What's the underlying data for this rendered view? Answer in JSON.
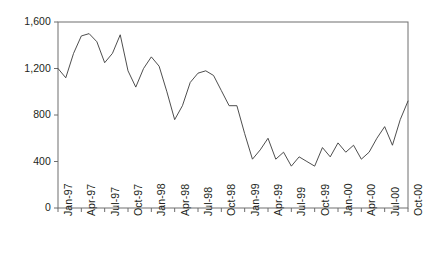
{
  "chart_data": {
    "type": "line",
    "title": "",
    "subtitle": "",
    "xlabel": "",
    "ylabel": "",
    "grid": false,
    "legend": false,
    "legend_position": "none",
    "line_color": "#3a3a3a",
    "axis_color": "#6e6e6e",
    "text_color": "#231f20",
    "background": "#ffffff",
    "ylim": [
      0,
      1600
    ],
    "ytick_values": [
      0,
      400,
      800,
      1200,
      1600
    ],
    "ytick_labels": [
      "0",
      "400",
      "800",
      "1,200",
      "1,600"
    ],
    "xtick_labels": [
      "Jan-97",
      "Apr-97",
      "Jul-97",
      "Oct-97",
      "Jan-98",
      "Apr-98",
      "Jul-98",
      "Oct-98",
      "Jan-99",
      "Apr-99",
      "Jul-99",
      "Oct-99",
      "Jan-00",
      "Apr-00",
      "Jul-00",
      "Oct-00"
    ],
    "x": [
      "Jan-97",
      "Feb-97",
      "Mar-97",
      "Apr-97",
      "May-97",
      "Jun-97",
      "Jul-97",
      "Aug-97",
      "Sep-97",
      "Oct-97",
      "Nov-97",
      "Dec-97",
      "Jan-98",
      "Feb-98",
      "Mar-98",
      "Apr-98",
      "May-98",
      "Jun-98",
      "Jul-98",
      "Aug-98",
      "Sep-98",
      "Oct-98",
      "Nov-98",
      "Dec-98",
      "Jan-99",
      "Feb-99",
      "Mar-99",
      "Apr-99",
      "May-99",
      "Jun-99",
      "Jul-99",
      "Aug-99",
      "Sep-99",
      "Oct-99",
      "Nov-99",
      "Dec-99",
      "Jan-00",
      "Feb-00",
      "Mar-00",
      "Apr-00",
      "May-00",
      "Jun-00",
      "Jul-00",
      "Aug-00",
      "Sep-00",
      "Oct-00"
    ],
    "values": [
      1200,
      1120,
      1330,
      1480,
      1500,
      1430,
      1250,
      1330,
      1490,
      1180,
      1040,
      1200,
      1300,
      1220,
      1000,
      760,
      880,
      1080,
      1160,
      1180,
      1140,
      1010,
      880,
      880,
      640,
      420,
      500,
      600,
      420,
      480,
      360,
      440,
      400,
      360,
      520,
      440,
      560,
      480,
      540,
      420,
      480,
      600,
      700,
      540,
      760,
      920
    ]
  }
}
